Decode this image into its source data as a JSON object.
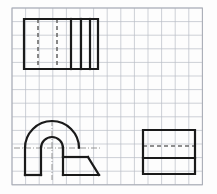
{
  "document": {
    "title": "Orthographic Views Sketch on Graph Paper",
    "type": "technical-drawing",
    "background_color": "#fdfdfd"
  },
  "canvas": {
    "width": 217,
    "height": 194
  },
  "grid": {
    "label": "graph-paper-grid",
    "origin_x": 12,
    "origin_y": 8,
    "cols": 14,
    "rows": 13,
    "cell_size": 13.6,
    "line_color": "#b9bdc6",
    "line_width": 0.7,
    "border_color": "#a8acb5",
    "border_width": 1.0
  },
  "style": {
    "visible_edge_color": "#1a1a1a",
    "visible_edge_width": 2.2,
    "hidden_edge_color": "#6b6b6b",
    "hidden_edge_width": 1.6,
    "hidden_dash_pattern": "4,3",
    "center_line_color": "#8a8a8a",
    "center_line_width": 0.9,
    "center_dash_pattern": "6,2,1,2"
  },
  "figures": [
    {
      "id": "figure-top-view",
      "name": "top-rectangle-with-hidden-lines",
      "description": "Upper rectangular orthographic view containing two hidden dashed vertical edges and three solid vertical division lines",
      "bounds": {
        "x": 24,
        "y": 19,
        "width": 74,
        "height": 50
      },
      "visible_edges": [
        {
          "name": "outer-rectangle",
          "points": "24,19 98,19 98,69 24,69 24,19"
        },
        {
          "name": "division-line-1",
          "points": "71,19 71,69"
        },
        {
          "name": "division-line-2",
          "points": "81,19 81,69"
        },
        {
          "name": "division-line-3",
          "points": "90,19 90,69"
        }
      ],
      "hidden_edges": [
        {
          "name": "hidden-edge-left",
          "points": "38,19 38,69"
        },
        {
          "name": "hidden-edge-right",
          "points": "57,19 57,69"
        }
      ],
      "center_lines": []
    },
    {
      "id": "figure-front-view",
      "name": "arch-block-with-tapered-base",
      "description": "Lower-left front view: outer semicircular arch on vertical walls, inner semicircular arch cut-out, flat base and a chamfered right-hand extension",
      "bounds": {
        "x": 25,
        "y": 126,
        "width": 74,
        "height": 49
      },
      "arch": {
        "center_x": 52,
        "base_y": 148,
        "outer_radius": 27,
        "inner_radius": 11,
        "wall_bottom_y": 175
      },
      "visible_edges": [
        {
          "name": "outer-arc",
          "points": "arc-outer"
        },
        {
          "name": "inner-arc",
          "points": "arc-inner"
        },
        {
          "name": "left-wall",
          "points": "25,148 25,175"
        },
        {
          "name": "left-base",
          "points": "25,175 41,175"
        },
        {
          "name": "inner-left-wall",
          "points": "41,148 41,175"
        },
        {
          "name": "inner-right-wall",
          "points": "63,148 63,175"
        },
        {
          "name": "right-base",
          "points": "63,175 99,175"
        },
        {
          "name": "platform-top",
          "points": "63,157 88,157"
        },
        {
          "name": "platform-right-wall",
          "points": "63,148 63,157"
        },
        {
          "name": "chamfer",
          "points": "88,157 99,175"
        }
      ],
      "hidden_edges": [],
      "center_lines": [
        {
          "name": "vertical-center-line",
          "points": "52,120 52,180"
        },
        {
          "name": "horizontal-center-line",
          "points": "14,148 100,148"
        }
      ]
    },
    {
      "id": "figure-side-view",
      "name": "side-rectangle-with-hidden-line",
      "description": "Lower-right side view rectangle with one hidden dashed horizontal edge near the top and one solid horizontal division line below it",
      "bounds": {
        "x": 143,
        "y": 130,
        "width": 52,
        "height": 44
      },
      "visible_edges": [
        {
          "name": "outer-rectangle",
          "points": "143,130 195,130 195,174 143,174 143,130"
        },
        {
          "name": "division-line-1",
          "points": "143,158 195,158"
        }
      ],
      "hidden_edges": [
        {
          "name": "hidden-edge-horizontal",
          "points": "143,146 195,146"
        }
      ],
      "center_lines": []
    }
  ]
}
